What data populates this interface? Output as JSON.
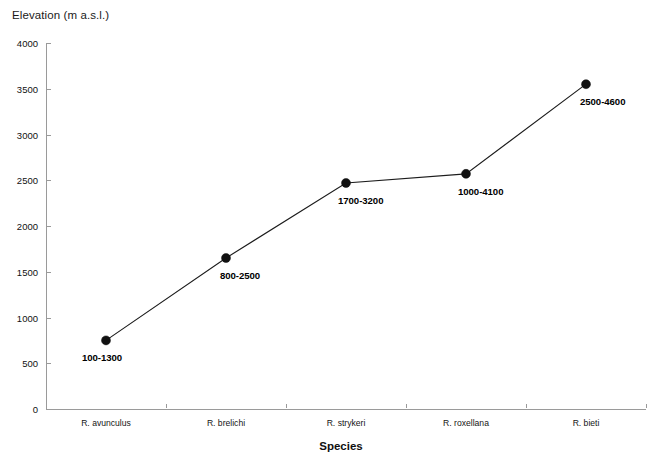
{
  "chart_data": {
    "type": "line",
    "title": "Elevation (m a.s.l.)",
    "xlabel": "Species",
    "ylabel": "Elevation (m a.s.l.)",
    "categories": [
      "R. avunculus",
      "R. brelichi",
      "R. strykeri",
      "R. roxellana",
      "R. bieti"
    ],
    "values": [
      750,
      1650,
      2470,
      2570,
      3550
    ],
    "point_labels": [
      "100-1300",
      "800-2500",
      "1700-3200",
      "1000-4100",
      "2500-4600"
    ],
    "ranges": [
      {
        "species": "R. avunculus",
        "min": 100,
        "max": 1300,
        "midpoint": 750
      },
      {
        "species": "R. brelichi",
        "min": 800,
        "max": 2500,
        "midpoint": 1650
      },
      {
        "species": "R. strykeri",
        "min": 1700,
        "max": 3200,
        "midpoint": 2470
      },
      {
        "species": "R. roxellana",
        "min": 1000,
        "max": 4100,
        "midpoint": 2570
      },
      {
        "species": "R. bieti",
        "min": 2500,
        "max": 4600,
        "midpoint": 3550
      }
    ],
    "ylim": [
      0,
      4000
    ],
    "yticks": [
      0,
      500,
      1000,
      1500,
      2000,
      2500,
      3000,
      3500,
      4000
    ],
    "ytick_labels": [
      "0",
      "500",
      "1000",
      "1500",
      "2000",
      "2500",
      "3000",
      "3500",
      "4000"
    ],
    "grid": false,
    "legend": null,
    "marker": "filled-circle",
    "line_color": "#1c1c1c",
    "marker_color": "#111111",
    "axis_color": "#9a9a9a",
    "background": "#ffffff"
  }
}
